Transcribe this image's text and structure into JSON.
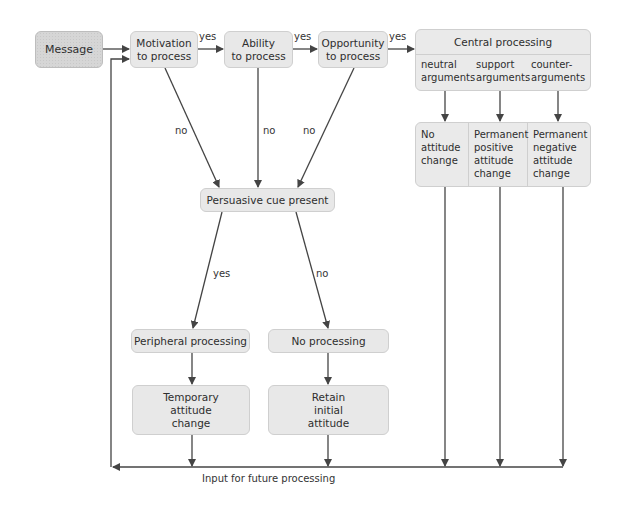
{
  "diagram": {
    "nodes": {
      "message": "Message",
      "motivation": "Motivation\nto process",
      "ability": "Ability\nto process",
      "opportunity": "Opportunity\nto process",
      "central": {
        "title": "Central processing",
        "columns": [
          "neutral\narguments",
          "support\narguments",
          "counter-\narguments"
        ]
      },
      "outcomes": [
        "No\nattitude\nchange",
        "Permanent\npositive\nattitude\nchange",
        "Permanent\nnegative\nattitude\nchange"
      ],
      "persuasive_cue": "Persuasive cue present",
      "peripheral": "Peripheral processing",
      "no_processing": "No processing",
      "temporary": "Temporary\nattitude\nchange",
      "retain": "Retain\ninitial\nattitude"
    },
    "edge_labels": {
      "motivation_yes": "yes",
      "ability_yes": "yes",
      "opportunity_yes": "yes",
      "motivation_no": "no",
      "ability_no": "no",
      "opportunity_no": "no",
      "cue_yes": "yes",
      "cue_no": "no"
    },
    "feedback_label": "Input for future processing",
    "colors": {
      "box_fill": "#e8e8e8",
      "message_fill": "#d6d6d6",
      "box_border": "#cfcfcf",
      "line": "#444444"
    }
  }
}
